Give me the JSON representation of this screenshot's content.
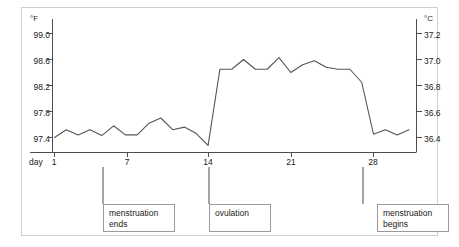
{
  "chart_data": {
    "type": "line",
    "title": "",
    "subtitle": "",
    "xlabel": "day",
    "ylabel": "°F",
    "ylabel_right": "°C",
    "grid": false,
    "legend": "none",
    "x": [
      1,
      2,
      3,
      4,
      5,
      6,
      7,
      8,
      9,
      10,
      11,
      12,
      13,
      14,
      15,
      16,
      17,
      18,
      19,
      20,
      21,
      22,
      23,
      24,
      25,
      26,
      27,
      28,
      29,
      30,
      31
    ],
    "xlim": [
      0.4,
      31.4
    ],
    "xticks": [
      1,
      7,
      14,
      21,
      28
    ],
    "xtick_labels": [
      "1",
      "7",
      "14",
      "21",
      "28"
    ],
    "ylim_f": [
      97.2,
      99.2
    ],
    "yticks_f": [
      97.4,
      97.8,
      98.2,
      98.6,
      99.0
    ],
    "ytick_labels_f": [
      "97.4",
      "97.8",
      "98.2",
      "98.6",
      "99.0"
    ],
    "ylim_c": [
      36.22,
      37.33
    ],
    "yticks_c": [
      36.4,
      36.6,
      36.8,
      37.0,
      37.2
    ],
    "ytick_labels_c": [
      "36.4",
      "36.6",
      "36.8",
      "37.0",
      "37.2"
    ],
    "series": [
      {
        "name": "basal body temperature",
        "unit": "°F",
        "values": [
          97.4,
          97.52,
          97.44,
          97.52,
          97.43,
          97.58,
          97.44,
          97.44,
          97.62,
          97.7,
          97.52,
          97.56,
          97.46,
          97.28,
          98.45,
          98.45,
          98.6,
          98.45,
          98.45,
          98.63,
          98.4,
          98.52,
          98.58,
          98.48,
          98.45,
          98.45,
          98.25,
          97.45,
          97.52,
          97.44,
          97.52
        ]
      }
    ],
    "line_color": "#555555",
    "axis_color": "#4d4d4d"
  },
  "axes": {
    "left_unit": "°F",
    "right_unit": "°C",
    "x_prefix": "day"
  },
  "annotations": [
    {
      "id": "menstruation-ends",
      "lines": [
        "menstruation",
        "ends"
      ],
      "anchor_day": 5
    },
    {
      "id": "ovulation",
      "lines": [
        "ovulation"
      ],
      "anchor_day": 14
    },
    {
      "id": "menstruation-begins",
      "lines": [
        "menstruation",
        "begins"
      ],
      "anchor_day": 28
    }
  ],
  "colors": {
    "frame": "#cfcfcf",
    "line": "#555555",
    "axis": "#4d4d4d",
    "callout_border": "#9a9a9a",
    "text": "#1a1a1a",
    "background": "#ffffff"
  }
}
